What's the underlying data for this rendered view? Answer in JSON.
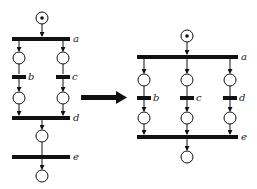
{
  "diagram": {
    "type": "petri-net-transformation",
    "left_net": {
      "transitions": [
        {
          "id": "a",
          "label": "a"
        },
        {
          "id": "b",
          "label": "b"
        },
        {
          "id": "c",
          "label": "c"
        },
        {
          "id": "d",
          "label": "d"
        },
        {
          "id": "e",
          "label": "e"
        }
      ],
      "initial_marking": "1 token in top place"
    },
    "right_net": {
      "transitions": [
        {
          "id": "a",
          "label": "a"
        },
        {
          "id": "b",
          "label": "b"
        },
        {
          "id": "c",
          "label": "c"
        },
        {
          "id": "d",
          "label": "d"
        },
        {
          "id": "e",
          "label": "e"
        }
      ],
      "initial_marking": "1 token in top place"
    },
    "arrow": "transforms-to"
  },
  "labels": {
    "l_a": "a",
    "l_b": "b",
    "l_c": "c",
    "l_d": "d",
    "l_e": "e",
    "r_a": "a",
    "r_b": "b",
    "r_c": "c",
    "r_d": "d",
    "r_e": "e"
  }
}
